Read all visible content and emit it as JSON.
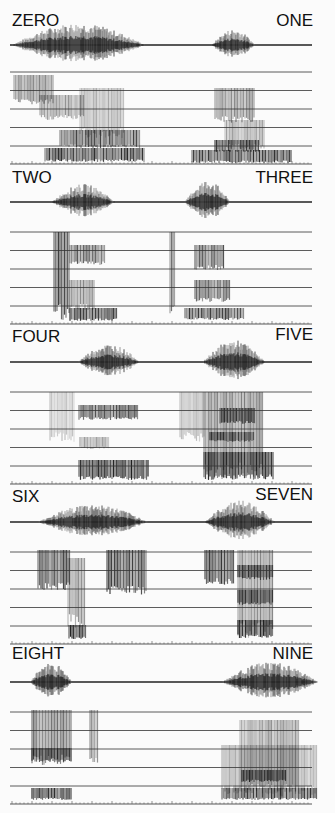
{
  "figure": {
    "panels": [
      {
        "left_label": "ZERO",
        "right_label": "ONE",
        "top": 0,
        "left_word": {
          "start": 12,
          "end": 145,
          "peak": 22
        },
        "right_word": {
          "start": 212,
          "end": 255,
          "peak": 16
        },
        "spectro_left": [
          {
            "x": 14,
            "y": 75,
            "w": 40,
            "h": 30,
            "o": 0.55
          },
          {
            "x": 40,
            "y": 95,
            "w": 45,
            "h": 25,
            "o": 0.45
          },
          {
            "x": 80,
            "y": 88,
            "w": 45,
            "h": 50,
            "o": 0.35
          },
          {
            "x": 60,
            "y": 130,
            "w": 80,
            "h": 18,
            "o": 0.8
          },
          {
            "x": 45,
            "y": 148,
            "w": 100,
            "h": 14,
            "o": 0.9
          }
        ],
        "spectro_right": [
          {
            "x": 215,
            "y": 88,
            "w": 40,
            "h": 35,
            "o": 0.5
          },
          {
            "x": 225,
            "y": 120,
            "w": 40,
            "h": 30,
            "o": 0.4
          },
          {
            "x": 215,
            "y": 140,
            "w": 45,
            "h": 12,
            "o": 0.85
          },
          {
            "x": 192,
            "y": 150,
            "w": 100,
            "h": 13,
            "o": 0.9
          }
        ]
      },
      {
        "left_label": "TWO",
        "right_label": "THREE",
        "top": 160,
        "left_word": {
          "start": 52,
          "end": 115,
          "peak": 18
        },
        "right_word": {
          "start": 185,
          "end": 230,
          "peak": 22
        },
        "spectro_left": [
          {
            "x": 54,
            "y": 232,
            "w": 16,
            "h": 88,
            "o": 0.85
          },
          {
            "x": 70,
            "y": 245,
            "w": 35,
            "h": 20,
            "o": 0.7
          },
          {
            "x": 70,
            "y": 280,
            "w": 25,
            "h": 30,
            "o": 0.55
          },
          {
            "x": 70,
            "y": 308,
            "w": 48,
            "h": 13,
            "o": 0.9
          }
        ],
        "spectro_right": [
          {
            "x": 170,
            "y": 232,
            "w": 6,
            "h": 88,
            "o": 0.7
          },
          {
            "x": 195,
            "y": 245,
            "w": 30,
            "h": 25,
            "o": 0.75
          },
          {
            "x": 195,
            "y": 280,
            "w": 35,
            "h": 22,
            "o": 0.65
          },
          {
            "x": 185,
            "y": 308,
            "w": 60,
            "h": 12,
            "o": 0.85
          }
        ]
      },
      {
        "left_label": "FOUR",
        "right_label": "FIVE",
        "top": 320,
        "left_word": {
          "start": 78,
          "end": 140,
          "peak": 18
        },
        "right_word": {
          "start": 203,
          "end": 265,
          "peak": 22
        },
        "spectro_left": [
          {
            "x": 50,
            "y": 392,
            "w": 25,
            "h": 50,
            "o": 0.25
          },
          {
            "x": 79,
            "y": 405,
            "w": 60,
            "h": 15,
            "o": 0.8
          },
          {
            "x": 80,
            "y": 437,
            "w": 30,
            "h": 12,
            "o": 0.4
          },
          {
            "x": 79,
            "y": 460,
            "w": 70,
            "h": 20,
            "o": 0.95
          }
        ],
        "spectro_right": [
          {
            "x": 180,
            "y": 392,
            "w": 25,
            "h": 50,
            "o": 0.3
          },
          {
            "x": 204,
            "y": 392,
            "w": 60,
            "h": 88,
            "o": 0.55
          },
          {
            "x": 220,
            "y": 408,
            "w": 35,
            "h": 16,
            "o": 0.85
          },
          {
            "x": 210,
            "y": 432,
            "w": 45,
            "h": 10,
            "o": 0.8
          },
          {
            "x": 204,
            "y": 452,
            "w": 70,
            "h": 28,
            "o": 0.9
          }
        ]
      },
      {
        "left_label": "SIX",
        "right_label": "SEVEN",
        "top": 480,
        "left_word": {
          "start": 38,
          "end": 148,
          "peak": 18
        },
        "right_word": {
          "start": 205,
          "end": 275,
          "peak": 22
        },
        "spectro_left": [
          {
            "x": 38,
            "y": 550,
            "w": 32,
            "h": 40,
            "o": 0.85
          },
          {
            "x": 68,
            "y": 558,
            "w": 18,
            "h": 70,
            "o": 0.5
          },
          {
            "x": 69,
            "y": 625,
            "w": 18,
            "h": 14,
            "o": 0.95
          },
          {
            "x": 107,
            "y": 550,
            "w": 40,
            "h": 45,
            "o": 0.85
          }
        ],
        "spectro_right": [
          {
            "x": 205,
            "y": 550,
            "w": 30,
            "h": 35,
            "o": 0.85
          },
          {
            "x": 238,
            "y": 550,
            "w": 35,
            "h": 88,
            "o": 0.5
          },
          {
            "x": 238,
            "y": 565,
            "w": 35,
            "h": 15,
            "o": 0.85
          },
          {
            "x": 238,
            "y": 590,
            "w": 35,
            "h": 15,
            "o": 0.85
          },
          {
            "x": 238,
            "y": 620,
            "w": 35,
            "h": 18,
            "o": 0.9
          }
        ]
      },
      {
        "left_label": "EIGHT",
        "right_label": "NINE",
        "top": 640,
        "left_word": {
          "start": 30,
          "end": 72,
          "peak": 20
        },
        "right_word": {
          "start": 222,
          "end": 318,
          "peak": 20
        },
        "spectro_left": [
          {
            "x": 32,
            "y": 710,
            "w": 40,
            "h": 55,
            "o": 0.6
          },
          {
            "x": 32,
            "y": 748,
            "w": 40,
            "h": 14,
            "o": 0.85
          },
          {
            "x": 90,
            "y": 710,
            "w": 8,
            "h": 55,
            "o": 0.45
          },
          {
            "x": 32,
            "y": 788,
            "w": 40,
            "h": 12,
            "o": 0.95
          }
        ],
        "spectro_right": [
          {
            "x": 240,
            "y": 720,
            "w": 60,
            "h": 80,
            "o": 0.45
          },
          {
            "x": 222,
            "y": 745,
            "w": 95,
            "h": 50,
            "o": 0.35
          },
          {
            "x": 242,
            "y": 770,
            "w": 45,
            "h": 12,
            "o": 0.9
          },
          {
            "x": 222,
            "y": 788,
            "w": 95,
            "h": 12,
            "o": 0.85
          }
        ]
      }
    ]
  }
}
